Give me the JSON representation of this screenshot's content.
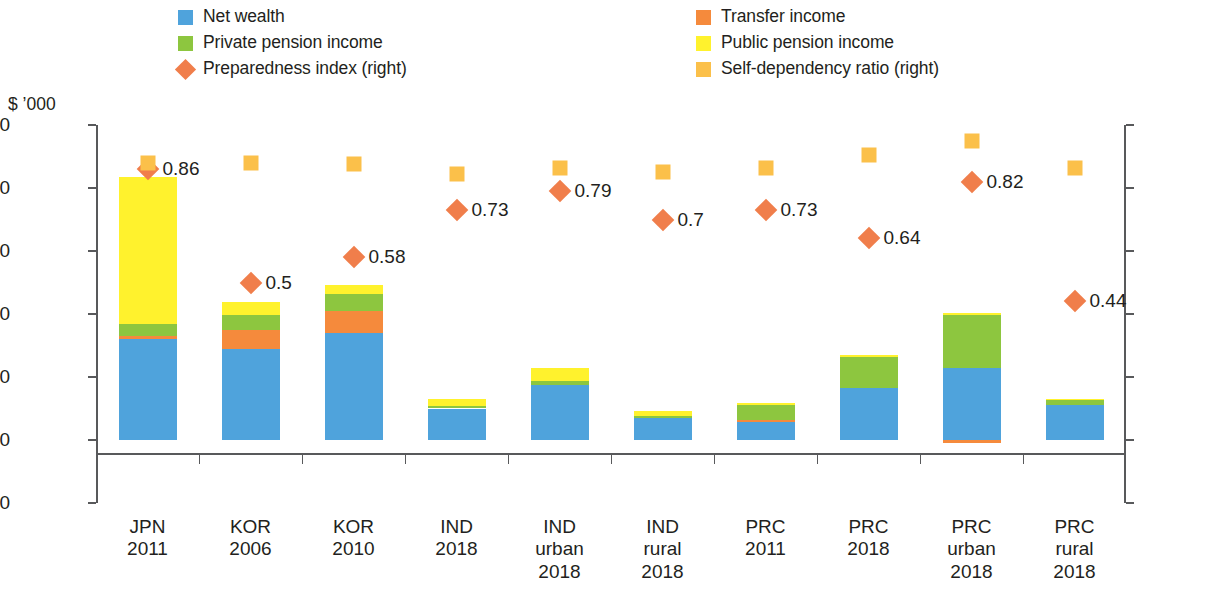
{
  "axis": {
    "left_unit_label": "$ ’000",
    "left_ticks": [
      "500",
      "400",
      "300",
      "200",
      "100",
      "0",
      "-100"
    ],
    "right_ticks": [
      "1",
      "0.8",
      "0.6",
      "0.4",
      "0.2",
      "0",
      "-0.2"
    ]
  },
  "legend": {
    "left_items": [
      {
        "label": "Net wealth",
        "marker": "square",
        "color": "#4FA3DC"
      },
      {
        "label": "Private pension income",
        "marker": "square",
        "color": "#8DC63F"
      },
      {
        "label": "Preparedness index (right)",
        "marker": "diamond",
        "color": "#F07E4B"
      }
    ],
    "right_items": [
      {
        "label": "Transfer income",
        "marker": "square",
        "color": "#F58A3C"
      },
      {
        "label": "Public pension income",
        "marker": "square",
        "color": "#FFF22D"
      },
      {
        "label": "Self-dependency ratio (right)",
        "marker": "square",
        "color": "#FBC04A"
      }
    ]
  },
  "chart_data": {
    "type": "bar",
    "title": "",
    "xlabel": "",
    "ylabel": "$ ’000",
    "ylabel_right": "",
    "ylim": [
      -100,
      500
    ],
    "ylim_right": [
      -0.2,
      1
    ],
    "grid": false,
    "legend_position": "top",
    "stacked": true,
    "categories": [
      "JPN\n2011",
      "KOR\n2006",
      "KOR\n2010",
      "IND\n2018",
      "IND\nurban\n2018",
      "IND\nrural\n2018",
      "PRC\n2011",
      "PRC\n2018",
      "PRC\nurban\n2018",
      "PRC\nrural\n2018"
    ],
    "category_lines": [
      [
        "JPN",
        "2011"
      ],
      [
        "KOR",
        "2006"
      ],
      [
        "KOR",
        "2010"
      ],
      [
        "IND",
        "2018"
      ],
      [
        "IND",
        "urban",
        "2018"
      ],
      [
        "IND",
        "rural",
        "2018"
      ],
      [
        "PRC",
        "2011"
      ],
      [
        "PRC",
        "2018"
      ],
      [
        "PRC",
        "urban",
        "2018"
      ],
      [
        "PRC",
        "rural",
        "2018"
      ]
    ],
    "series": [
      {
        "name": "Net wealth",
        "color": "#4FA3DC",
        "values": [
          160,
          145,
          170,
          50,
          88,
          35,
          28,
          83,
          115,
          55
        ]
      },
      {
        "name": "Transfer income",
        "color": "#F58A3C",
        "values": [
          5,
          30,
          35,
          0,
          0,
          0,
          3,
          0,
          -5,
          0
        ]
      },
      {
        "name": "Private pension income",
        "color": "#8DC63F",
        "values": [
          19,
          23,
          27,
          4,
          6,
          3,
          25,
          48,
          83,
          9
        ]
      },
      {
        "name": "Public pension income",
        "color": "#FFF22D",
        "values": [
          234,
          21,
          14,
          11,
          20,
          8,
          3,
          4,
          3,
          1
        ]
      }
    ],
    "overlay_series": [
      {
        "name": "Preparedness index (right)",
        "color": "#F07E4B",
        "marker": "diamond",
        "axis": "right",
        "values": [
          0.86,
          0.5,
          0.58,
          0.73,
          0.79,
          0.7,
          0.73,
          0.64,
          0.82,
          0.44
        ],
        "labels": [
          "0.86",
          "0.5",
          "0.58",
          "0.73",
          "0.79",
          "0.7",
          "0.73",
          "0.64",
          "0.82",
          "0.44"
        ]
      },
      {
        "name": "Self-dependency ratio (right)",
        "color": "#FBC04A",
        "marker": "square",
        "axis": "right",
        "values": [
          0.88,
          0.88,
          0.875,
          0.845,
          0.865,
          0.85,
          0.865,
          0.905,
          0.95,
          0.865
        ],
        "labels": [
          "",
          "",
          "",
          "",
          "",
          "",
          "",
          "",
          "",
          ""
        ]
      }
    ]
  }
}
